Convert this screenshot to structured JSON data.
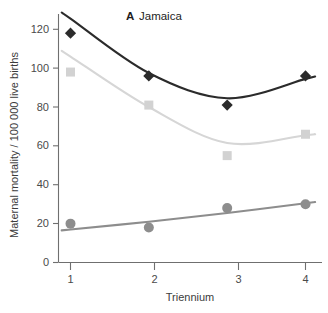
{
  "panel": {
    "letter": "A",
    "name": "Jamaica"
  },
  "chart_data": {
    "type": "scatter",
    "xlabel": "Triennium",
    "ylabel": "Maternal mortality / 100 000  live births",
    "xlim": [
      0.72,
      4.28
    ],
    "ylim": [
      0,
      126
    ],
    "x": [
      1,
      2,
      3,
      4
    ],
    "xticks": [
      "1",
      "2",
      "3",
      "4"
    ],
    "yticks": [
      "0",
      "20",
      "40",
      "60",
      "80",
      "100",
      "120"
    ],
    "ytick_values": [
      0,
      20,
      40,
      60,
      80,
      100,
      120
    ],
    "grid": false,
    "legend": "none",
    "series": [
      {
        "name": "Series 1",
        "marker": "diamond",
        "color": "#2b2b2b",
        "line_color": "#2b2b2b",
        "values": [
          118,
          96,
          81,
          96
        ],
        "fit": [
          125.5,
          97.5,
          84.5,
          94.5
        ]
      },
      {
        "name": "Series 2",
        "marker": "square",
        "color": "#d2d2d2",
        "line_color": "#d6d6d6",
        "values": [
          98,
          81,
          55,
          66
        ],
        "fit": [
          106,
          80,
          61.5,
          65.5
        ]
      },
      {
        "name": "Series 3",
        "marker": "circle",
        "color": "#8d8d8d",
        "line_color": "#8d8d8d",
        "values": [
          20,
          18,
          28,
          30
        ],
        "fit": [
          17,
          21,
          25.5,
          30.5
        ]
      }
    ]
  },
  "colors": {
    "axis": "#6f6f6f",
    "tick_text": "#4a4a4a",
    "background": "#ffffff",
    "dark_series": "#2b2b2b",
    "light_series": "#d2d2d2",
    "mid_series": "#8d8d8d"
  }
}
